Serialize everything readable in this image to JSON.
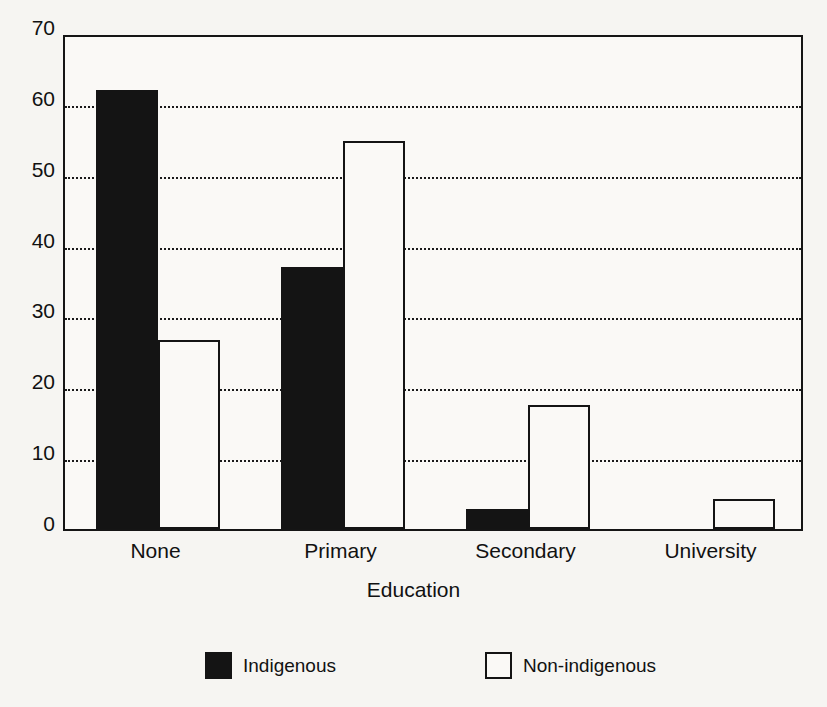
{
  "chart_data": {
    "type": "bar",
    "title": "",
    "xlabel": "Education",
    "ylabel": "",
    "categories": [
      "None",
      "Primary",
      "Secondary",
      "University"
    ],
    "series": [
      {
        "name": "Indigenous",
        "values": [
          62.0,
          37.0,
          2.8,
          0.0
        ]
      },
      {
        "name": "Non-indigenous",
        "values": [
          26.7,
          54.7,
          17.5,
          4.3
        ]
      }
    ],
    "ylim": [
      0,
      70
    ],
    "yticks": [
      0,
      10,
      20,
      30,
      40,
      50,
      60,
      70
    ],
    "ytick_labels": [
      "0",
      "10",
      "20",
      "30",
      "40",
      "50",
      "60",
      "70"
    ],
    "grid": true,
    "gridlines_at": [
      10,
      20,
      30,
      40,
      50,
      60
    ],
    "legend_position": "bottom",
    "colors": {
      "indigenous": "#141414",
      "non_indigenous": "#faf9f6",
      "outline": "#141414",
      "background": "#f6f5f2",
      "plot_background": "#faf9f6"
    }
  },
  "legend": {
    "items": [
      {
        "label": "Indigenous",
        "swatch": "filled-square"
      },
      {
        "label": "Non-indigenous",
        "swatch": "hollow-square"
      }
    ]
  }
}
